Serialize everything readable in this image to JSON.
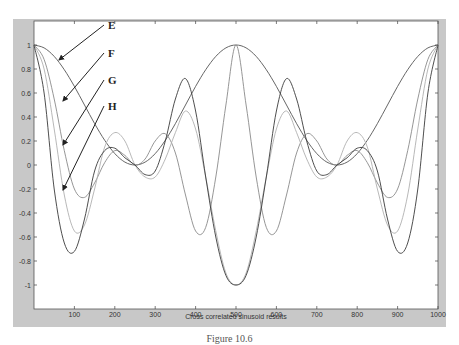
{
  "chart_data": {
    "type": "line",
    "title": "",
    "xlabel": "Cross correlated sinusoid results",
    "ylabel": "",
    "xlim": [
      0,
      1000
    ],
    "ylim": [
      -1.1,
      1.1
    ],
    "grid": false,
    "x_ticks": [
      100,
      200,
      300,
      400,
      500,
      600,
      700,
      800,
      900,
      1000
    ],
    "y_ticks": [
      1,
      0.8,
      0.6,
      0.4,
      0.2,
      0,
      -0.2,
      -0.4,
      -0.6,
      -0.8,
      -1
    ],
    "y_tick_labels": [
      "1",
      "0.8",
      "0.6",
      "0.4",
      "0.2",
      "0",
      "-0.2",
      "-0.4",
      "-0.6",
      "-0.8",
      "-1"
    ],
    "x": [
      0,
      25,
      50,
      75,
      100,
      125,
      150,
      175,
      200,
      225,
      250,
      275,
      300,
      325,
      350,
      375,
      400,
      425,
      450,
      475,
      500,
      525,
      550,
      575,
      600,
      625,
      650,
      675,
      700,
      725,
      750,
      775,
      800,
      825,
      850,
      875,
      900,
      925,
      950,
      975,
      1000
    ],
    "series": [
      {
        "name": "E",
        "color": "#555555",
        "values": [
          1.0,
          0.976,
          0.905,
          0.794,
          0.655,
          0.5,
          0.345,
          0.206,
          0.095,
          0.024,
          0.0,
          0.024,
          0.095,
          0.206,
          0.345,
          0.5,
          0.655,
          0.794,
          0.905,
          0.976,
          1.0,
          0.976,
          0.905,
          0.794,
          0.655,
          0.5,
          0.345,
          0.206,
          0.095,
          0.024,
          0.0,
          0.024,
          0.095,
          0.206,
          0.345,
          0.5,
          0.655,
          0.794,
          0.905,
          0.976,
          1.0
        ]
      },
      {
        "name": "F",
        "color": "#8a8a8a",
        "values": [
          1.0,
          0.88,
          0.55,
          0.12,
          -0.2,
          -0.27,
          -0.15,
          0.02,
          0.12,
          0.08,
          0.0,
          0.05,
          0.2,
          0.26,
          0.1,
          -0.25,
          -0.55,
          -0.52,
          -0.1,
          0.5,
          1.0,
          0.5,
          -0.1,
          -0.52,
          -0.55,
          -0.25,
          0.1,
          0.26,
          0.2,
          0.05,
          0.0,
          0.08,
          0.12,
          0.02,
          -0.15,
          -0.27,
          -0.2,
          0.12,
          0.55,
          0.88,
          1.0
        ]
      },
      {
        "name": "G",
        "color": "#b0b0b0",
        "values": [
          1.0,
          0.8,
          0.3,
          -0.25,
          -0.55,
          -0.5,
          -0.2,
          0.15,
          0.27,
          0.2,
          0.0,
          -0.1,
          -0.1,
          0.05,
          0.27,
          0.45,
          0.3,
          -0.1,
          -0.55,
          -0.9,
          -1.0,
          -0.9,
          -0.55,
          -0.1,
          0.3,
          0.45,
          0.27,
          0.05,
          -0.1,
          -0.1,
          0.0,
          0.2,
          0.27,
          0.15,
          -0.2,
          -0.5,
          -0.55,
          -0.25,
          0.3,
          0.8,
          1.0
        ]
      },
      {
        "name": "H",
        "color": "#3a3a3a",
        "values": [
          1.0,
          0.6,
          -0.2,
          -0.65,
          -0.72,
          -0.45,
          -0.05,
          0.12,
          0.14,
          0.06,
          0.0,
          -0.08,
          -0.05,
          0.2,
          0.55,
          0.72,
          0.45,
          -0.1,
          -0.6,
          -0.92,
          -1.0,
          -0.92,
          -0.6,
          -0.1,
          0.45,
          0.72,
          0.55,
          0.2,
          -0.05,
          -0.08,
          0.0,
          0.06,
          0.14,
          0.12,
          -0.05,
          -0.45,
          -0.72,
          -0.65,
          -0.2,
          0.6,
          1.0
        ]
      }
    ],
    "annotations": [
      {
        "label": "E",
        "arrow_to_x": 25,
        "arrow_to_y": 0.88
      },
      {
        "label": "F",
        "arrow_to_x": 25,
        "arrow_to_y": 0.5
      },
      {
        "label": "G",
        "arrow_to_x": 25,
        "arrow_to_y": 0.15
      },
      {
        "label": "H",
        "arrow_to_x": 25,
        "arrow_to_y": -0.22
      }
    ]
  },
  "caption": "Figure 10.6"
}
